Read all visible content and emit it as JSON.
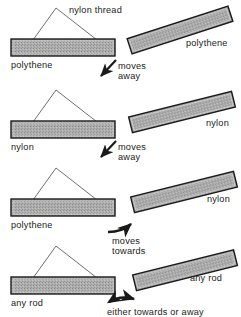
{
  "figure": {
    "type": "physics-electrostatics-diagram",
    "colors": {
      "rod_fill": "#a9a9a9",
      "rod_stroke": "#1a1a1a",
      "thread_stroke": "#555555",
      "text": "#222222",
      "background": "#ffffff"
    }
  },
  "labels": {
    "thread": "nylon thread"
  },
  "panels": [
    {
      "id": "panel-1",
      "suspended_rod_label": "polythene",
      "held_rod_label": "polythene",
      "motion_label_line1": "moves",
      "motion_label_line2": "away",
      "motion": "away",
      "arrow_type": "straight"
    },
    {
      "id": "panel-2",
      "suspended_rod_label": "nylon",
      "held_rod_label": "nylon",
      "motion_label_line1": "moves",
      "motion_label_line2": "away",
      "motion": "away",
      "arrow_type": "straight"
    },
    {
      "id": "panel-3",
      "suspended_rod_label": "polythene",
      "held_rod_label": "nylon",
      "motion_label_line1": "moves",
      "motion_label_line2": "towards",
      "motion": "towards",
      "arrow_type": "curved"
    },
    {
      "id": "panel-4",
      "suspended_rod_label": "any rod",
      "held_rod_label": "any rod",
      "motion_label_line1": "either towards or away",
      "motion_label_line2": "",
      "motion": "either",
      "arrow_type": "double-curved"
    }
  ]
}
